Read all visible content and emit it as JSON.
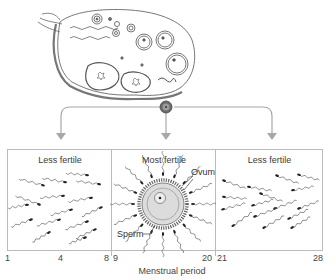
{
  "diagram": {
    "top_illustration": "ovary-with-follicles",
    "released_cell": "ovum",
    "panels": [
      {
        "title": "Less fertile",
        "day_start": "1",
        "day_mid": "4",
        "day_end": "8",
        "content": "sperm-swimming"
      },
      {
        "title": "Most fertile",
        "day_start": "9",
        "day_end": "20",
        "content": "sperm-surrounding-ovum",
        "labels": {
          "ovum": "Ovum",
          "sperm": "Sperm"
        }
      },
      {
        "title": "Less fertile",
        "day_start": "21",
        "day_end": "28",
        "content": "sperm-swimming"
      }
    ],
    "axis_label": "Menstrual period"
  },
  "colors": {
    "line": "#9a9a9a",
    "panel_border": "#b5b5b5",
    "ovum_fill": "#d9d9d9",
    "ink": "#333333"
  }
}
